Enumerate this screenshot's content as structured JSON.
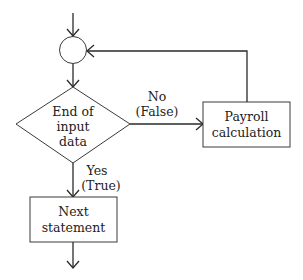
{
  "diagram": {
    "type": "flowchart",
    "colors": {
      "line": "#2a2a2a",
      "text": "#222222",
      "background": "#ffffff"
    },
    "nodes": {
      "connector": {
        "shape": "circle",
        "label": ""
      },
      "decision": {
        "shape": "diamond",
        "lines": [
          "End of",
          "input",
          "data"
        ]
      },
      "process": {
        "shape": "rectangle",
        "lines": [
          "Payroll",
          "calculation"
        ]
      },
      "next": {
        "shape": "rectangle",
        "lines": [
          "Next",
          "statement"
        ]
      }
    },
    "edges": {
      "no_branch": {
        "from": "decision",
        "to": "process",
        "lines": [
          "No",
          "(False)"
        ]
      },
      "yes_branch": {
        "from": "decision",
        "to": "next",
        "lines": [
          "Yes",
          "(True)"
        ]
      },
      "loop_back": {
        "from": "process",
        "to": "connector",
        "label": ""
      },
      "entry": {
        "to": "connector",
        "label": ""
      },
      "exit": {
        "from": "next",
        "label": ""
      }
    }
  }
}
